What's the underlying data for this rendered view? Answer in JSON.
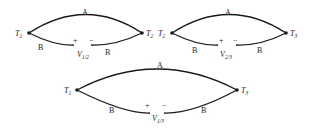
{
  "diagrams": [
    {
      "id": "top-left",
      "left_node": {
        "label": "T",
        "sub": "1"
      },
      "right_node": {
        "label": "T",
        "sub": "2"
      },
      "top_wire": "A",
      "bottom_left_wire": "B",
      "bottom_right_wire": "B",
      "plus": "+",
      "minus": "−",
      "voltage": {
        "label": "V",
        "sub": "1/2"
      }
    },
    {
      "id": "top-right",
      "left_node": {
        "label": "T",
        "sub": "2"
      },
      "right_node": {
        "label": "T",
        "sub": "3"
      },
      "top_wire": "A",
      "bottom_left_wire": "B",
      "bottom_right_wire": "B",
      "plus": "+",
      "minus": "−",
      "voltage": {
        "label": "V",
        "sub": "2/3"
      }
    },
    {
      "id": "bottom",
      "left_node": {
        "label": "T",
        "sub": "1"
      },
      "right_node": {
        "label": "T",
        "sub": "3"
      },
      "top_wire": "A",
      "bottom_left_wire": "B",
      "bottom_right_wire": "B",
      "plus": "+",
      "minus": "−",
      "voltage": {
        "label": "V",
        "sub": "1/3"
      }
    }
  ],
  "colors": {
    "wire": "#1a1a1a",
    "text": "#222222"
  }
}
